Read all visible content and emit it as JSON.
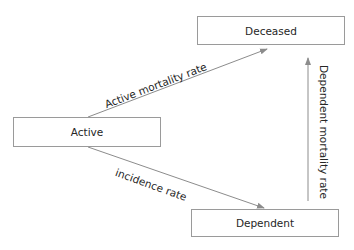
{
  "diagram": {
    "type": "state-transition",
    "nodes": [
      {
        "id": "deceased",
        "label": "Deceased"
      },
      {
        "id": "active",
        "label": "Active"
      },
      {
        "id": "dependent",
        "label": "Dependent"
      }
    ],
    "edges": [
      {
        "from": "active",
        "to": "deceased",
        "label": "Active mortality rate"
      },
      {
        "from": "active",
        "to": "dependent",
        "label": "incidence rate"
      },
      {
        "from": "dependent",
        "to": "deceased",
        "label": "Dependent mortality rate"
      }
    ],
    "colors": {
      "box_border": "#9a9a9a",
      "arrow": "#8c8c8c",
      "text": "#262626",
      "background": "#ffffff"
    }
  }
}
